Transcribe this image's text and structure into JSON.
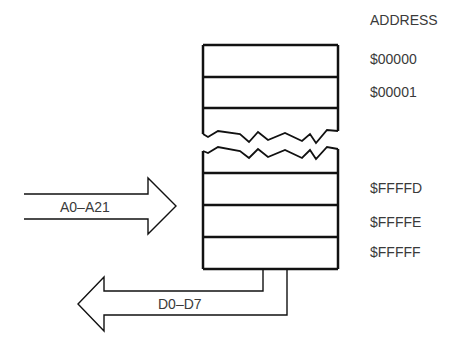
{
  "header": {
    "address_label": "ADDRESS"
  },
  "memory": {
    "addresses": [
      "$00000",
      "$00001",
      "$FFFFD",
      "$FFFFE",
      "$FFFFF"
    ]
  },
  "buses": {
    "address_bus": "A0–A21",
    "data_bus": "D0–D7"
  },
  "colors": {
    "stroke": "#111111",
    "text": "#3a3a3a",
    "background": "#ffffff"
  }
}
